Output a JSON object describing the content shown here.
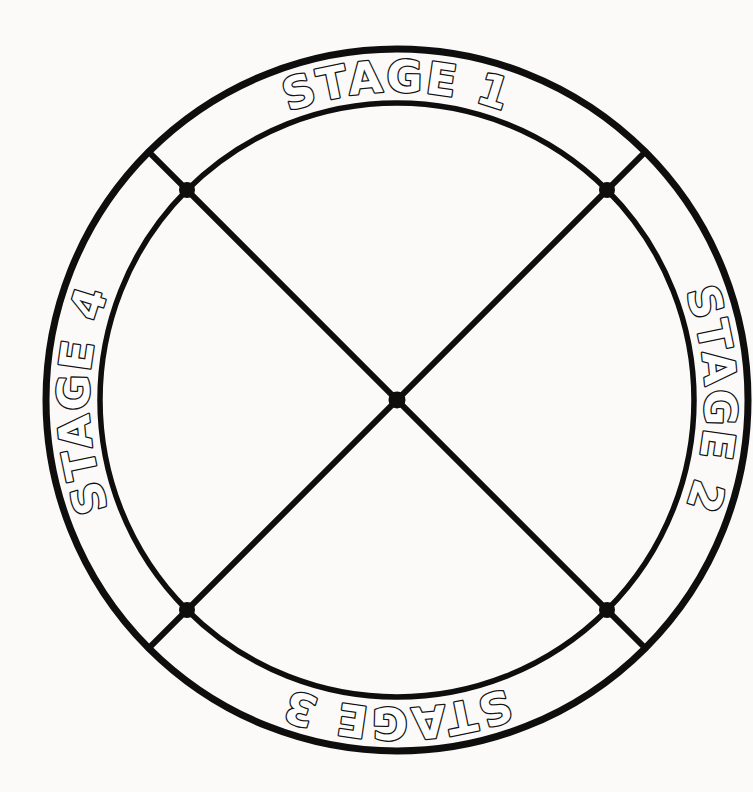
{
  "diagram": {
    "labels": {
      "stage1": "STAGE 1",
      "stage2": "STAGE 2",
      "stage3": "STAGE 3",
      "stage4": "STAGE 4"
    },
    "colors": {
      "line": "#0e0e0e",
      "letter_fill": "#ffffff",
      "letter_outline": "#141414",
      "background": "#fbfaf8"
    }
  }
}
